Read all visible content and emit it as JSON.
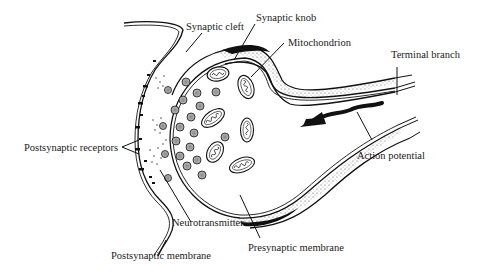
{
  "diagram": {
    "labels": {
      "synaptic_cleft": "Synaptic cleft",
      "synaptic_knob": "Synaptic knob",
      "mitochondrion": "Mitochondrion",
      "terminal_branch": "Terminal branch",
      "postsynaptic_receptors": "Postsynaptic receptors",
      "action_potential": "Action potential",
      "neurotransmitter": "Neurotransmitter",
      "postsynaptic_membrane": "Postsynaptic membrane",
      "presynaptic_membrane": "Presynaptic membrane"
    },
    "colors": {
      "ink": "#111111",
      "background": "#ffffff"
    }
  }
}
